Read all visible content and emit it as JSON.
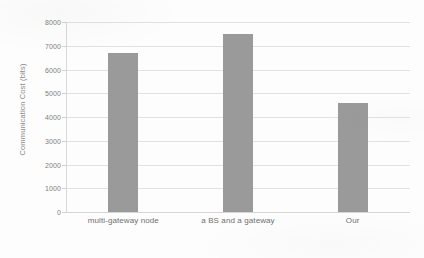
{
  "chart_data": {
    "type": "bar",
    "title": "",
    "xlabel": "",
    "ylabel": "Communication Cost (bits)",
    "categories": [
      "multi-gateway node",
      "a BS and a gateway",
      "Our"
    ],
    "values": [
      6700,
      7500,
      4600
    ],
    "ylim": [
      0,
      8000
    ],
    "yticks": [
      0,
      1000,
      2000,
      3000,
      4000,
      5000,
      6000,
      7000,
      8000
    ],
    "ytick_labels": [
      "0",
      "1000",
      "2000",
      "3000",
      "4000",
      "5000",
      "6000",
      "7000",
      "8000"
    ],
    "grid": true,
    "legend": "none",
    "bar_color": "#9a9a9a",
    "gridline_color": "#e2e2e2",
    "axis_text_color": "#7d7d7d",
    "background_color": "#fdfdfd"
  }
}
